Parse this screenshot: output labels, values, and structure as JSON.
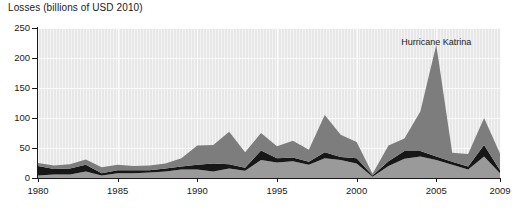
{
  "chart_data": {
    "type": "area",
    "stacked": true,
    "title": "Losses (billions of USD 2010)",
    "xlabel": "",
    "ylabel": "Losses (billions of USD 2010)",
    "ylim": [
      0,
      250
    ],
    "xlim": [
      1980,
      2009
    ],
    "yticks": [
      0,
      50,
      100,
      150,
      200,
      250
    ],
    "ytick_labels": [
      "0",
      "50",
      "100",
      "150",
      "200",
      "250"
    ],
    "xticks": [
      1980,
      1985,
      1990,
      1995,
      2000,
      2005,
      2009
    ],
    "xtick_labels": [
      "1980",
      "1985",
      "1990",
      "1995",
      "2000",
      "2005",
      "2009"
    ],
    "grid": "horizontal-and-vertical",
    "legend": "none",
    "x": [
      1980,
      1981,
      1982,
      1983,
      1984,
      1985,
      1986,
      1987,
      1988,
      1989,
      1990,
      1991,
      1992,
      1993,
      1994,
      1995,
      1996,
      1997,
      1998,
      1999,
      2000,
      2001,
      2002,
      2003,
      2004,
      2005,
      2006,
      2007,
      2008,
      2009
    ],
    "series": [
      {
        "name": "lower-band",
        "color": "#9a9a9a",
        "values": [
          4,
          6,
          6,
          11,
          4,
          8,
          8,
          9,
          11,
          14,
          14,
          11,
          16,
          12,
          30,
          26,
          28,
          22,
          33,
          30,
          24,
          2,
          20,
          32,
          36,
          30,
          22,
          14,
          36,
          8
        ]
      },
      {
        "name": "middle-band",
        "color": "#171717",
        "values": [
          16,
          9,
          10,
          11,
          4,
          5,
          5,
          4,
          5,
          5,
          8,
          13,
          7,
          5,
          16,
          7,
          6,
          5,
          10,
          5,
          9,
          2,
          8,
          13,
          9,
          6,
          5,
          5,
          19,
          5
        ]
      },
      {
        "name": "upper-band",
        "color": "#7d7d7d",
        "values": [
          5,
          6,
          7,
          9,
          10,
          9,
          7,
          8,
          8,
          14,
          32,
          31,
          54,
          26,
          29,
          20,
          28,
          20,
          62,
          37,
          27,
          3,
          26,
          21,
          66,
          186,
          15,
          21,
          45,
          28
        ]
      }
    ],
    "annotations": [
      {
        "text": "Hurricane Katrina",
        "x": 2005,
        "y": 235
      }
    ]
  },
  "axis": {
    "y_title": "Losses (billions of USD 2010)"
  }
}
